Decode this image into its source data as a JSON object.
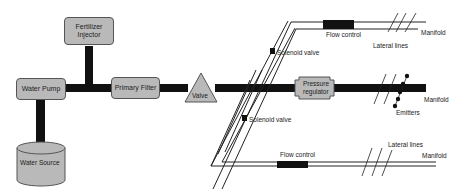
{
  "diagram": {
    "components": {
      "fertilizer_injector": "Fertilizer Injector",
      "water_pump": "Water Pump",
      "primary_filter": "Primary Filter",
      "water_source": "Water Source",
      "valve": "Valve",
      "pressure_regulator": "Pressure regulator"
    },
    "labels": {
      "solenoid_valve_top": "Solenoid valve",
      "solenoid_valve_bottom": "Solenoid valve",
      "flow_control_top": "Flow control",
      "flow_control_bottom": "Flow control",
      "lateral_lines_top": "Lateral lines",
      "lateral_lines_bottom": "Lateral lines",
      "manifold_top": "Manifold",
      "manifold_middle": "Manifold",
      "manifold_bottom": "Manifold",
      "emitters": "Emitters"
    },
    "colors": {
      "component_fill": "#b9b9b9",
      "pipe": "#111111",
      "outline": "#555555"
    }
  }
}
